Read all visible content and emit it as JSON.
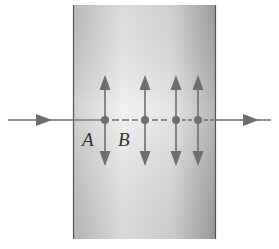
{
  "diagram": {
    "slab": {
      "x": 73,
      "y": 5,
      "width": 143,
      "height": 234,
      "fill_light": "#f2f2f2",
      "fill_mid": "#dcdcdc",
      "fill_dark": "#b0b0b0",
      "border": "#555555"
    },
    "ray": {
      "y": 120,
      "x_start": 8,
      "x_end": 271,
      "color": "#6e6e6e",
      "incoming_arrow_x": 45,
      "outgoing_arrow_x": 258
    },
    "points": [
      {
        "id": "A-point",
        "x": 105,
        "y": 120
      },
      {
        "id": "B-point",
        "x": 145,
        "y": 120
      },
      {
        "id": "p3",
        "x": 176,
        "y": 120
      },
      {
        "id": "p4",
        "x": 198,
        "y": 120
      }
    ],
    "oscillation": {
      "top_y": 75,
      "bottom_y": 166,
      "color": "#6e6e6e"
    },
    "labels": [
      {
        "text": "A",
        "x": 82,
        "y": 146
      },
      {
        "text": "B",
        "x": 118,
        "y": 146
      }
    ]
  }
}
